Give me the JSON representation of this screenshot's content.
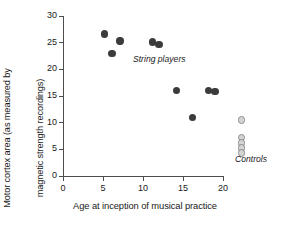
{
  "chart_data": {
    "type": "scatter",
    "title": "",
    "xlabel": "Age at inception of musical practice",
    "ylabel": "Motor cortex area (as measured by magnetic strength recordings)",
    "ylabel_lines": [
      "Motor cortex area (as measured by",
      "magnetic strength recordings)"
    ],
    "xlim": [
      0,
      20
    ],
    "ylim": [
      0,
      30
    ],
    "xticks": [
      0,
      5,
      10,
      15,
      20
    ],
    "yticks": [
      0,
      5,
      10,
      15,
      20,
      25,
      30
    ],
    "xtick_labels": [
      "0",
      "5",
      "10",
      "15",
      "20"
    ],
    "ytick_labels": [
      "0",
      "5",
      "10",
      "15",
      "20",
      "25",
      "30"
    ],
    "grid": false,
    "legend_position": "in-plot annotations",
    "series": [
      {
        "name": "String players",
        "marker": "filled-circle",
        "color": "#3b3b3b",
        "annotation": "String players",
        "points": [
          {
            "x": 5.2,
            "y": 26.6
          },
          {
            "x": 6.1,
            "y": 23.0
          },
          {
            "x": 7.1,
            "y": 25.3
          },
          {
            "x": 11.2,
            "y": 25.1
          },
          {
            "x": 12.0,
            "y": 24.7
          },
          {
            "x": 14.2,
            "y": 16.0
          },
          {
            "x": 16.2,
            "y": 11.0
          },
          {
            "x": 18.2,
            "y": 16.0
          },
          {
            "x": 19.0,
            "y": 15.8
          }
        ]
      },
      {
        "name": "Controls",
        "marker": "open-circle",
        "color": "#d4d4d4",
        "edge_color": "#8c8c8c",
        "annotation": "Controls",
        "points": [
          {
            "x": 22.3,
            "y": 10.5
          },
          {
            "x": 22.3,
            "y": 7.2
          },
          {
            "x": 22.3,
            "y": 6.2
          },
          {
            "x": 22.3,
            "y": 5.2
          },
          {
            "x": 22.3,
            "y": 4.3
          }
        ]
      }
    ]
  }
}
